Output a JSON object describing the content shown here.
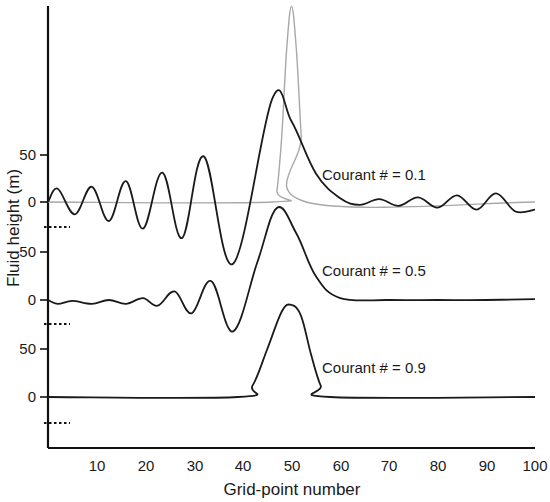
{
  "chart_data": {
    "type": "line",
    "title": "",
    "xlabel": "Grid-point number",
    "ylabel": "Fluid height (m)",
    "xlim": [
      0,
      100
    ],
    "x_ticks": [
      10,
      20,
      30,
      40,
      50,
      60,
      70,
      80,
      90,
      100
    ],
    "grid": false,
    "legend": "none (inline annotations)",
    "panels": [
      {
        "name": "top",
        "annotation": "Courant # = 0.1",
        "y_ticks": [
          0,
          50
        ],
        "series": [
          {
            "name": "Initial condition",
            "color": "#a8a8a8",
            "x": [
              0,
              46,
              47,
              48,
              49,
              50,
              51,
              52,
              53,
              100
            ],
            "y": [
              0,
              0,
              12,
              70,
              160,
              206,
              160,
              70,
              0,
              0
            ]
          },
          {
            "name": "Courant # = 0.1",
            "color": "#1a1a1a",
            "x": [
              0,
              2,
              5.5,
              9,
              12.5,
              16,
              19.5,
              23.5,
              27.5,
              32,
              38,
              46,
              50,
              55,
              60,
              64,
              68,
              72,
              76,
              80,
              84,
              88,
              92,
              96,
              100
            ],
            "y": [
              0,
              14,
              -13,
              16,
              -20,
              22,
              -28,
              31,
              -38,
              48,
              -65,
              108,
              85,
              30,
              4,
              -3,
              3,
              -4,
              5,
              -6,
              7,
              -8,
              9,
              -10,
              -8
            ]
          }
        ]
      },
      {
        "name": "middle",
        "annotation": "Courant # = 0.5",
        "y_ticks": [
          0,
          50
        ],
        "series": [
          {
            "name": "Courant # = 0.5",
            "color": "#1a1a1a",
            "x": [
              0,
              2,
              5,
              9,
              12.5,
              16,
              19.5,
              22.5,
              26,
              29.5,
              33.5,
              38,
              43,
              47,
              51,
              55,
              60,
              70,
              80,
              90,
              100
            ],
            "y": [
              0,
              -4,
              -1,
              -4,
              0,
              -4,
              2,
              -6,
              9,
              -14,
              20,
              -33,
              40,
              97,
              70,
              25,
              2,
              0,
              0,
              0,
              1
            ]
          }
        ]
      },
      {
        "name": "bottom",
        "annotation": "Courant # = 0.9",
        "y_ticks": [
          0,
          50
        ],
        "series": [
          {
            "name": "Courant # = 0.9",
            "color": "#1a1a1a",
            "x": [
              0,
              39,
              42,
              45,
              48,
              50,
              52,
              54,
              56,
              58,
              100
            ],
            "y": [
              0,
              0,
              12,
              50,
              90,
              97,
              85,
              45,
              12,
              0,
              0
            ]
          }
        ]
      }
    ]
  },
  "labels": {
    "xlabel": "Grid-point number",
    "ylabel": "Fluid height (m)",
    "annot_top": "Courant # = 0.1",
    "annot_mid": "Courant # = 0.5",
    "annot_bot": "Courant # = 0.9",
    "x_ticks": [
      "10",
      "20",
      "30",
      "40",
      "50",
      "60",
      "70",
      "80",
      "90",
      "100"
    ],
    "y_top_0": "0",
    "y_top_50": "50",
    "y_mid_0": "0",
    "y_mid_50": "50",
    "y_bot_0": "0",
    "y_bot_50": "50"
  }
}
